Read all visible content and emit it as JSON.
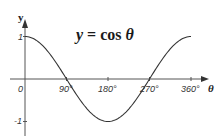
{
  "chart_data": {
    "type": "line",
    "title": "y = cos θ",
    "title_parts": {
      "var": "y",
      "eq": " = cos ",
      "arg": "θ"
    },
    "xlabel": "θ",
    "ylabel": "y",
    "x_ticks": [
      "0",
      "90°",
      "180°",
      "270°",
      "360°"
    ],
    "x_tick_values": [
      0,
      90,
      180,
      270,
      360
    ],
    "y_ticks": [
      "1",
      "-1"
    ],
    "y_tick_values": [
      1,
      -1
    ],
    "xlim": [
      0,
      360
    ],
    "ylim": [
      -1,
      1
    ],
    "grid": false,
    "legend": null,
    "series": [
      {
        "name": "cos θ",
        "x": [
          0,
          30,
          60,
          90,
          120,
          150,
          180,
          210,
          240,
          270,
          300,
          330,
          360
        ],
        "values": [
          1,
          0.866,
          0.5,
          0,
          -0.5,
          -0.866,
          -1,
          -0.866,
          -0.5,
          0,
          0.5,
          0.866,
          1
        ],
        "color": "#333333"
      }
    ]
  },
  "colors": {
    "axis": "#444444",
    "curve": "#333333",
    "text": "#222222",
    "background": "#ffffff"
  }
}
